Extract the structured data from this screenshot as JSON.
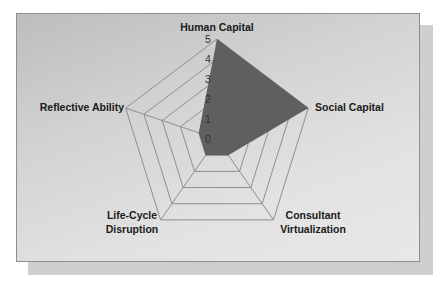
{
  "chart_data": {
    "type": "radar",
    "title": "",
    "categories": [
      "Human Capital",
      "Social Capital",
      "Consultant Virtualization",
      "Life-Cycle Disruption",
      "Reflective Ability"
    ],
    "series": [
      {
        "name": "Series1",
        "values": [
          5,
          5,
          1,
          1,
          1
        ],
        "color": "#5f5f5f"
      }
    ],
    "r_ticks": [
      "0",
      "1",
      "2",
      "3",
      "4",
      "5"
    ],
    "rlim": [
      0,
      5
    ],
    "grid": true,
    "legend": "none"
  },
  "labels": {
    "human_capital": "Human Capital",
    "social_capital": "Social Capital",
    "consultant_line1": "Consultant",
    "consultant_line2": "Virtualization",
    "lifecycle_line1": "Life-Cycle",
    "lifecycle_line2": "Disruption",
    "reflective_ability": "Reflective Ability",
    "tick0": "0",
    "tick1": "1",
    "tick2": "2",
    "tick3": "3",
    "tick4": "4",
    "tick5": "5"
  }
}
